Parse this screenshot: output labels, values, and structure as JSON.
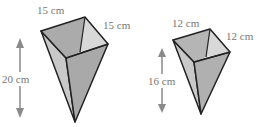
{
  "figures": [
    {
      "name": "large-pyramid",
      "top_edge_label": "15 cm",
      "side_edge_label": "15 cm",
      "height_label": "20 cm"
    },
    {
      "name": "small-pyramid",
      "top_edge_label": "12 cm",
      "side_edge_label": "12 cm",
      "height_label": "16 cm"
    }
  ],
  "colors": {
    "front_face": "#a9a9a9",
    "side_face": "#c9c9c9",
    "inner": "#b5b5b5",
    "inner_light": "#d8d8d8",
    "edge": "#222222",
    "arrow": "#8a8a8a",
    "label": "#777777"
  }
}
